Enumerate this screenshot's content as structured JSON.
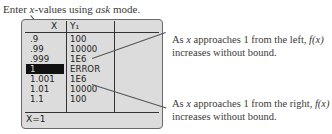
{
  "caption_top": {
    "prefix": "Enter ",
    "var": "x",
    "middle": "-values using ",
    "mode": "ask",
    "suffix": " mode."
  },
  "table": {
    "headers": [
      "X",
      "Y₁",
      ""
    ],
    "rows": [
      {
        "x": ".9",
        "y": "100"
      },
      {
        "x": ".99",
        "y": "10000"
      },
      {
        "x": ".999",
        "y": "1E6"
      },
      {
        "x": "1",
        "y": "ERROR",
        "selected": true
      },
      {
        "x": "1.001",
        "y": "1E6"
      },
      {
        "x": "1.01",
        "y": "10000"
      },
      {
        "x": "1.1",
        "y": "100"
      }
    ],
    "status": "X=1"
  },
  "annotations": [
    {
      "line1_a": "As ",
      "line1_var": "x",
      "line1_b": " approaches 1 from the left, ",
      "line1_fx": "f(x)",
      "line2": "increases without bound."
    },
    {
      "line1_a": "As ",
      "line1_var": "x",
      "line1_b": " approaches 1 from the right, ",
      "line1_fx": "f(x)",
      "line2": "increases without bound."
    }
  ],
  "colors": {
    "screen_bg": "#dcdcdc",
    "text": "#3a3a3a",
    "highlight": "#111111"
  }
}
